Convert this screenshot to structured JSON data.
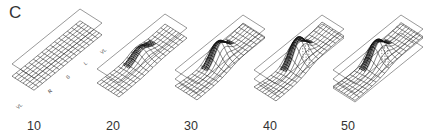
{
  "figure": {
    "panel_letter": "C",
    "colors": {
      "line": "#222222",
      "plane": "#555555",
      "background": "#ffffff"
    },
    "axis_marks": [
      "VL",
      "R",
      "S",
      "L",
      "VL"
    ],
    "panels": [
      {
        "label": "10",
        "label_x": 27,
        "ox": 12,
        "oy": 90,
        "planes": 1,
        "deform": 0.05,
        "ridge": 0.0,
        "drip": 0
      },
      {
        "label": "20",
        "label_x": 106,
        "ox": 97,
        "oy": 95,
        "planes": 1,
        "deform": 0.4,
        "ridge": 0.5,
        "drip": 0
      },
      {
        "label": "30",
        "label_x": 184,
        "ox": 175,
        "oy": 96,
        "planes": 2,
        "deform": 0.8,
        "ridge": 1.1,
        "drip": 0
      },
      {
        "label": "40",
        "label_x": 263,
        "ox": 254,
        "oy": 96,
        "planes": 2,
        "deform": 1.0,
        "ridge": 1.4,
        "drip": 1
      },
      {
        "label": "50",
        "label_x": 341,
        "ox": 333,
        "oy": 96,
        "planes": 3,
        "deform": 0.9,
        "ridge": 1.2,
        "drip": 1
      }
    ]
  }
}
